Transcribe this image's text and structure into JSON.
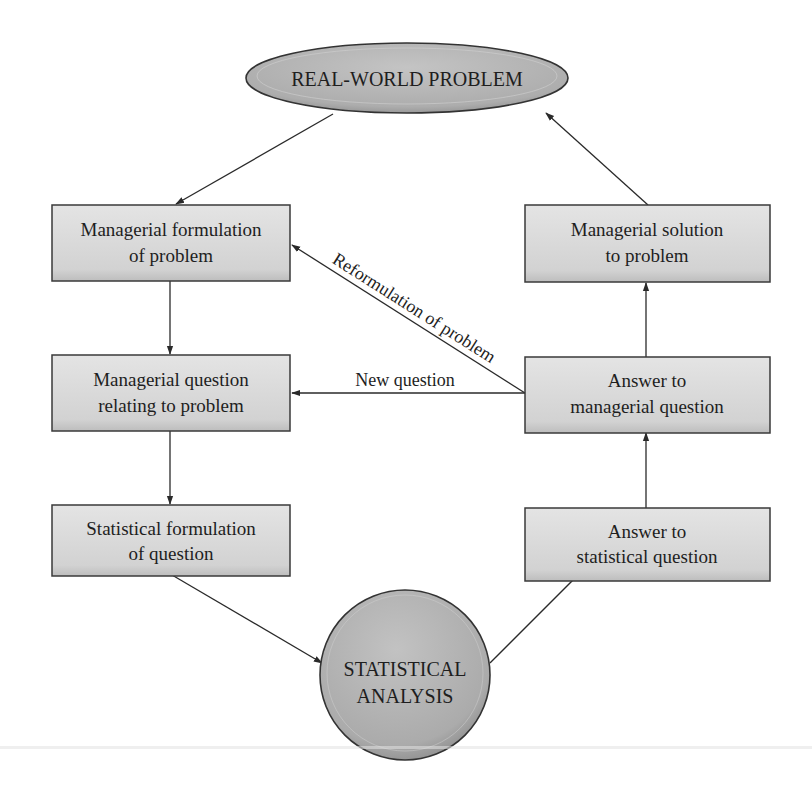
{
  "diagram": {
    "top_node": {
      "label": "REAL-WORLD PROBLEM"
    },
    "bottom_node": {
      "label_line1": "STATISTICAL",
      "label_line2": "ANALYSIS"
    },
    "left_boxes": [
      {
        "line1": "Managerial formulation",
        "line2": "of problem"
      },
      {
        "line1": "Managerial question",
        "line2": "relating to problem"
      },
      {
        "line1": "Statistical formulation",
        "line2": "of question"
      }
    ],
    "right_boxes": [
      {
        "line1": "Managerial solution",
        "line2": "to problem"
      },
      {
        "line1": "Answer to",
        "line2": "managerial question"
      },
      {
        "line1": "Answer to",
        "line2": "statistical question"
      }
    ],
    "edge_labels": {
      "reformulation": "Reformulation of problem",
      "new_question": "New question"
    },
    "colors": {
      "box_fill": "#d6d6d6",
      "box_border": "#3a3a3a",
      "node_fill": "#b4b4b4",
      "arrow": "#2a2a2a"
    }
  }
}
